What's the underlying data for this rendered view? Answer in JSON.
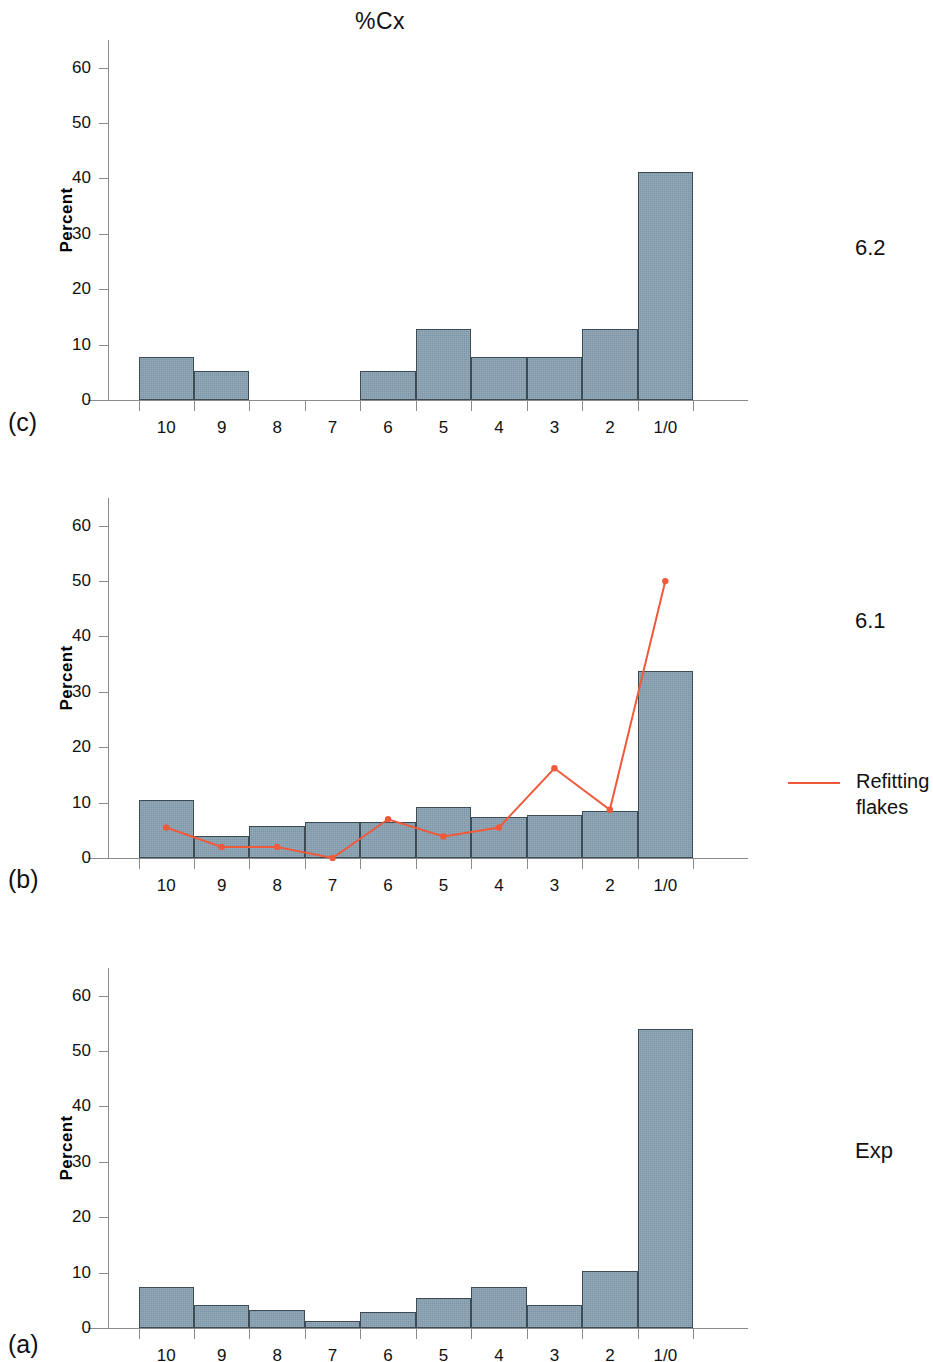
{
  "figure": {
    "title": "%Cx",
    "y_axis_label": "Percent",
    "y_ticks": [
      0,
      10,
      20,
      30,
      40,
      50,
      60
    ],
    "y_limit": [
      0,
      65
    ],
    "x_categories": [
      "10",
      "9",
      "8",
      "7",
      "6",
      "5",
      "4",
      "3",
      "2",
      "1/0"
    ],
    "bar_color": "#7d96a8",
    "bar_edge_color": "#3d4b55",
    "line_color": "#f0593a"
  },
  "legend": {
    "series_label_line1": "Refitting",
    "series_label_line2": "flakes"
  },
  "panels": [
    {
      "key": "c",
      "panel_label": "(c)",
      "side_label": "6.2"
    },
    {
      "key": "b",
      "panel_label": "(b)",
      "side_label": "6.1"
    },
    {
      "key": "a",
      "panel_label": "(a)",
      "side_label": "Exp"
    }
  ],
  "chart_data": [
    {
      "type": "bar",
      "panel": "(c)",
      "annotation": "6.2",
      "title": "%Cx",
      "xlabel": "",
      "ylabel": "Percent",
      "ylim": [
        0,
        65
      ],
      "yticks": [
        0,
        10,
        20,
        30,
        40,
        50,
        60
      ],
      "grid": false,
      "categories": [
        "10",
        "9",
        "8",
        "7",
        "6",
        "5",
        "4",
        "3",
        "2",
        "1/0"
      ],
      "values": [
        7.8,
        5.2,
        0,
        0,
        5.2,
        12.8,
        7.8,
        7.8,
        12.8,
        41.2
      ]
    },
    {
      "type": "bar",
      "panel": "(b)",
      "annotation": "6.1",
      "title": "%Cx",
      "xlabel": "",
      "ylabel": "Percent",
      "ylim": [
        0,
        65
      ],
      "yticks": [
        0,
        10,
        20,
        30,
        40,
        50,
        60
      ],
      "grid": false,
      "categories": [
        "10",
        "9",
        "8",
        "7",
        "6",
        "5",
        "4",
        "3",
        "2",
        "1/0"
      ],
      "values": [
        10.5,
        4.0,
        5.8,
        6.5,
        6.5,
        9.3,
        7.4,
        7.7,
        8.5,
        33.7
      ],
      "overlay_series": {
        "name": "Refitting flakes",
        "type": "line",
        "color": "#f0593a",
        "values": [
          5.5,
          2.0,
          2.0,
          0.0,
          7.0,
          3.9,
          5.5,
          16.2,
          8.7,
          50.0
        ]
      }
    },
    {
      "type": "bar",
      "panel": "(a)",
      "annotation": "Exp",
      "title": "%Cx",
      "xlabel": "",
      "ylabel": "Percent",
      "ylim": [
        0,
        65
      ],
      "yticks": [
        0,
        10,
        20,
        30,
        40,
        50,
        60
      ],
      "grid": false,
      "categories": [
        "10",
        "9",
        "8",
        "7",
        "6",
        "5",
        "4",
        "3",
        "2",
        "1/0"
      ],
      "values": [
        7.4,
        4.2,
        3.2,
        1.3,
        2.9,
        5.5,
        7.4,
        4.1,
        10.3,
        54.0
      ]
    }
  ]
}
